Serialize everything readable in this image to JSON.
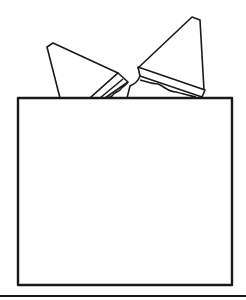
{
  "illustration": {
    "subject": "sandwich-halves-in-box",
    "colors": {
      "stroke": "#1a1a1a",
      "fill": "#ffffff",
      "background": "#ffffff"
    }
  }
}
